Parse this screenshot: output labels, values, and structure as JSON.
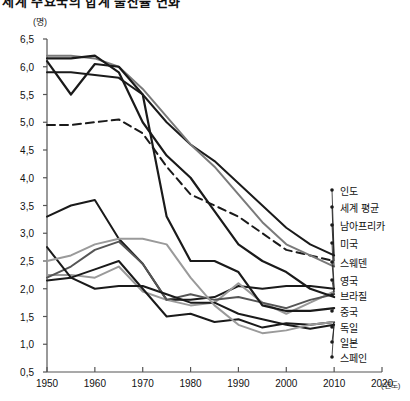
{
  "title": "세계 주요국의 합계 출산율 변화",
  "axes": {
    "y_unit": "(명)",
    "x_unit": "(연도)",
    "y_ticks": [
      "6,5",
      "6,0",
      "5,5",
      "5,0",
      "4,5",
      "4,0",
      "3,5",
      "3,0",
      "2,5",
      "2,0",
      "1,5",
      "1,0",
      "0,5"
    ],
    "x_ticks": [
      "1950",
      "1960",
      "1970",
      "1980",
      "1990",
      "2000",
      "2010",
      "2020"
    ]
  },
  "chart_data": {
    "type": "line",
    "title": "세계 주요국의 합계 출산율 변화",
    "xlabel": "(연도)",
    "ylabel": "(명)",
    "xlim": [
      1950,
      2020
    ],
    "ylim": [
      0.5,
      6.5
    ],
    "ytick_step": 0.5,
    "grid": false,
    "legend_position": "right",
    "x": [
      1950,
      1955,
      1960,
      1965,
      1970,
      1975,
      1980,
      1985,
      1990,
      1995,
      2000,
      2005,
      2010
    ],
    "series": [
      {
        "name": "인도",
        "color": "#1a1a1a",
        "style": "solid",
        "width": 2.0,
        "values": [
          5.9,
          5.9,
          5.85,
          5.8,
          5.5,
          5.0,
          4.6,
          4.3,
          3.9,
          3.5,
          3.1,
          2.8,
          2.6
        ]
      },
      {
        "name": "세계 평균",
        "color": "#1a1a1a",
        "style": "dashed",
        "width": 2.0,
        "values": [
          4.95,
          4.95,
          5.0,
          5.05,
          4.8,
          4.2,
          3.7,
          3.5,
          3.3,
          3.0,
          2.7,
          2.6,
          2.5
        ]
      },
      {
        "name": "남아프리카",
        "color": "#7a7a7a",
        "style": "solid",
        "width": 2.0,
        "values": [
          6.2,
          6.2,
          6.15,
          6.0,
          5.6,
          5.1,
          4.6,
          4.2,
          3.7,
          3.2,
          2.8,
          2.6,
          2.4
        ]
      },
      {
        "name": "미국",
        "color": "#1a1a1a",
        "style": "solid",
        "width": 2.0,
        "values": [
          3.3,
          3.5,
          3.6,
          2.9,
          2.45,
          1.8,
          1.8,
          1.85,
          2.05,
          2.0,
          2.05,
          2.05,
          2.0
        ]
      },
      {
        "name": "스웨덴",
        "color": "#9a9a9a",
        "style": "solid",
        "width": 2.0,
        "values": [
          2.25,
          2.25,
          2.2,
          2.4,
          1.95,
          1.8,
          1.7,
          1.75,
          2.1,
          1.75,
          1.55,
          1.75,
          1.95
        ]
      },
      {
        "name": "영국",
        "color": "#555555",
        "style": "solid",
        "width": 2.0,
        "values": [
          2.2,
          2.4,
          2.7,
          2.85,
          2.45,
          1.8,
          1.9,
          1.8,
          1.85,
          1.75,
          1.65,
          1.8,
          1.9
        ]
      },
      {
        "name": "브라질",
        "color": "#1a1a1a",
        "style": "solid",
        "width": 2.2,
        "values": [
          6.15,
          6.15,
          6.2,
          5.9,
          5.0,
          4.4,
          4.0,
          3.4,
          2.8,
          2.5,
          2.3,
          2.0,
          1.85
        ]
      },
      {
        "name": "중국",
        "color": "#1a1a1a",
        "style": "solid",
        "width": 2.2,
        "values": [
          6.1,
          5.5,
          6.05,
          6.0,
          5.5,
          3.3,
          2.5,
          2.5,
          2.3,
          1.7,
          1.6,
          1.6,
          1.65
        ]
      },
      {
        "name": "독일",
        "color": "#1a1a1a",
        "style": "solid",
        "width": 2.0,
        "values": [
          2.15,
          2.2,
          2.35,
          2.5,
          2.0,
          1.5,
          1.55,
          1.4,
          1.45,
          1.3,
          1.38,
          1.35,
          1.4
        ]
      },
      {
        "name": "일본",
        "color": "#1a1a1a",
        "style": "solid",
        "width": 2.0,
        "values": [
          2.75,
          2.2,
          2.0,
          2.05,
          2.05,
          1.9,
          1.75,
          1.75,
          1.55,
          1.45,
          1.35,
          1.28,
          1.35
        ]
      },
      {
        "name": "스페인",
        "color": "#9a9a9a",
        "style": "solid",
        "width": 2.0,
        "values": [
          2.5,
          2.6,
          2.8,
          2.9,
          2.9,
          2.8,
          2.2,
          1.7,
          1.35,
          1.2,
          1.25,
          1.35,
          1.4
        ]
      }
    ]
  },
  "legend": [
    {
      "label": "인도",
      "y": 190
    },
    {
      "label": "세계 평균",
      "y": 207
    },
    {
      "label": "남아프리카",
      "y": 225
    },
    {
      "label": "미국",
      "y": 243
    },
    {
      "label": "스웨덴",
      "y": 262
    },
    {
      "label": "영국",
      "y": 280
    },
    {
      "label": "브라질",
      "y": 295
    },
    {
      "label": "중국",
      "y": 311
    },
    {
      "label": "독일",
      "y": 327
    },
    {
      "label": "일본",
      "y": 342
    },
    {
      "label": "스페인",
      "y": 357
    }
  ]
}
